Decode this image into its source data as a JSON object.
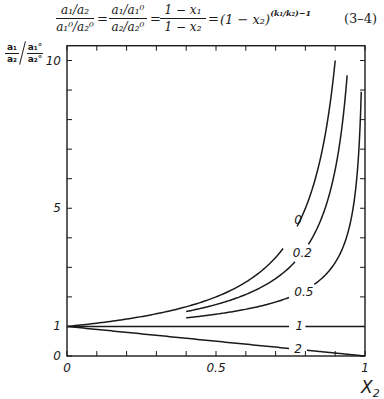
{
  "equation": {
    "frac1": {
      "num": "a₁/a₂",
      "den": "a₁⁰/a₂⁰"
    },
    "frac2": {
      "num": "a₁/a₁⁰",
      "den": "a₂/a₂⁰"
    },
    "frac3": {
      "num": "1 − x₁",
      "den": "1 − x₂"
    },
    "equals": "=",
    "power_base": "(1 − x₂)",
    "power_exponent": "(k₁/k₂)−1",
    "number": "(3–4)"
  },
  "chart_data": {
    "type": "line",
    "title": "",
    "equation": "(a1/a2)/(a1°/a2°) = (a1/a1°)/(a2/a2°) = (1−x1)/(1−x2) = (1−x2)^((k1/k2)−1)",
    "xlabel": "X₂",
    "ylabel": "(a₁/a₂) / (a₁°/a₂°)",
    "ylabel_parts": {
      "num1": "a₁",
      "den1": "a₂",
      "num2": "a₁°",
      "den2": "a₂°"
    },
    "xlim": [
      0,
      1
    ],
    "ylim": [
      0,
      10.5
    ],
    "grid": false,
    "legend": "inline curve labels",
    "x_ticks": [
      0,
      0.1,
      0.2,
      0.3,
      0.4,
      0.5,
      0.6,
      0.7,
      0.8,
      0.9,
      1.0
    ],
    "x_tick_labels": [
      {
        "value": 0,
        "label": "0"
      },
      {
        "value": 0.5,
        "label": "0.5"
      },
      {
        "value": 1,
        "label": "1"
      }
    ],
    "y_ticks": [
      0,
      1,
      2,
      3,
      4,
      5,
      6,
      7,
      8,
      9,
      10
    ],
    "y_tick_labels": [
      {
        "value": 0,
        "label": "0"
      },
      {
        "value": 1,
        "label": "1"
      },
      {
        "value": 5,
        "label": "5"
      },
      {
        "value": 10,
        "label": "10"
      }
    ],
    "series": [
      {
        "name": "0",
        "label": "0",
        "k_ratio": 0,
        "x": [
          0,
          0.1,
          0.2,
          0.3,
          0.4,
          0.5,
          0.6,
          0.7,
          0.8,
          0.85,
          0.88,
          0.9
        ],
        "values": [
          1.0,
          1.11,
          1.25,
          1.43,
          1.67,
          2.0,
          2.5,
          3.33,
          5.0,
          6.67,
          8.33,
          10.0
        ],
        "label_pos": [
          0.775,
          4.6
        ]
      },
      {
        "name": "0.2",
        "label": "0.2",
        "k_ratio": 0.2,
        "x": [
          0.4,
          0.5,
          0.6,
          0.7,
          0.8,
          0.85,
          0.9,
          0.94
        ],
        "values": [
          1.5,
          1.74,
          2.08,
          2.62,
          3.62,
          4.56,
          6.31,
          9.5
        ],
        "label_pos": [
          0.79,
          3.5
        ]
      },
      {
        "name": "0.5",
        "label": "0.5",
        "k_ratio": 0.5,
        "x": [
          0.4,
          0.5,
          0.6,
          0.7,
          0.8,
          0.9,
          0.95,
          0.98,
          0.9875
        ],
        "values": [
          1.29,
          1.41,
          1.58,
          1.83,
          2.24,
          3.16,
          4.47,
          7.07,
          8.8
        ],
        "label_pos": [
          0.795,
          2.15
        ]
      },
      {
        "name": "1",
        "label": "1",
        "k_ratio": 1,
        "x": [
          0,
          1
        ],
        "values": [
          1,
          1
        ],
        "label_pos": [
          0.78,
          1.0
        ]
      },
      {
        "name": "2",
        "label": "2",
        "k_ratio": 2,
        "x": [
          0,
          1
        ],
        "values": [
          1,
          0
        ],
        "label_pos": [
          0.775,
          0.23
        ]
      }
    ]
  }
}
